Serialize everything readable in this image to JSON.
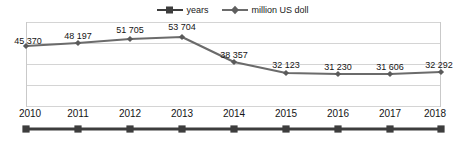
{
  "chart_data": {
    "type": "line",
    "title": "",
    "xlabel": "",
    "ylabel": "",
    "categories": [
      "2010",
      "2011",
      "2012",
      "2013",
      "2014",
      "2015",
      "2016",
      "2017",
      "2018"
    ],
    "series": [
      {
        "name": "years",
        "marker": "square",
        "color": "#3d3d3d",
        "values": [
          2010,
          2011,
          2012,
          2013,
          2014,
          2015,
          2016,
          2017,
          2018
        ],
        "labels": [
          "2010",
          "2011",
          "2012",
          "2013",
          "2014",
          "2015",
          "2016",
          "2017",
          "2018"
        ]
      },
      {
        "name": "million US doll",
        "marker": "diamond",
        "color": "#6b6b6b",
        "values": [
          45370,
          48197,
          51705,
          53704,
          38357,
          32123,
          31230,
          31606,
          32292
        ],
        "labels": [
          "45 370",
          "48 197",
          "51 705",
          "53 704",
          "38 357",
          "32 123",
          "31 230",
          "31 606",
          "32 292"
        ]
      }
    ],
    "grid": true,
    "gridlines": 5,
    "legend_position": "top-center",
    "ylim": [
      0,
      60000
    ]
  },
  "legend": {
    "entries": [
      {
        "label": "years",
        "marker": "square",
        "color": "#3d3d3d"
      },
      {
        "label": "million US doll",
        "marker": "diamond",
        "color": "#6b6b6b"
      }
    ]
  },
  "colors": {
    "grid": "#d4d4d4",
    "axis": "#c9c9c9",
    "value_series": "#6b6b6b",
    "year_series": "#3d3d3d",
    "text": "#151515",
    "background": "#ffffff"
  },
  "geometry": {
    "plot_left": 26,
    "plot_right": 441,
    "plot_top": 22,
    "plot_bottom": 107,
    "x_positions": [
      26,
      78,
      130,
      182,
      234,
      286,
      338,
      390,
      441
    ],
    "value_point_y": [
      46,
      43,
      39,
      37,
      62,
      73,
      74,
      74,
      72
    ],
    "value_label_y": [
      36,
      31,
      25,
      22,
      50,
      60,
      62,
      62,
      60
    ],
    "year_line_y": 129
  }
}
